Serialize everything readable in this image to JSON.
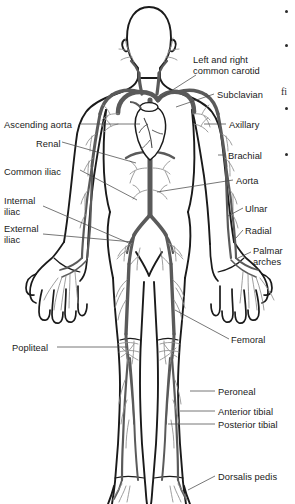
{
  "figure": {
    "view": "anterior",
    "colors": {
      "outline": "#1a1a1a",
      "artery_major": "#5a5a5a",
      "artery_minor": "#8c8c8c",
      "label_text": "#1a1a1a",
      "leader_line": "#4a4a4a",
      "background": "#ffffff"
    }
  },
  "labels_left": [
    {
      "id": "ascending-aorta",
      "text": "Ascending aorta",
      "x": 4,
      "y": 120
    },
    {
      "id": "renal",
      "text": "Renal",
      "x": 36,
      "y": 139
    },
    {
      "id": "common-iliac",
      "text": "Common iliac",
      "x": 4,
      "y": 167
    },
    {
      "id": "internal-iliac",
      "text": "Internal\niliac",
      "x": 4,
      "y": 196
    },
    {
      "id": "external-iliac",
      "text": "External\niliac",
      "x": 4,
      "y": 224
    },
    {
      "id": "popliteal",
      "text": "Popliteal",
      "x": 12,
      "y": 343
    }
  ],
  "labels_right": [
    {
      "id": "common-carotid",
      "text": "Left and right\ncommon carotid",
      "x": 193,
      "y": 55
    },
    {
      "id": "subclavian",
      "text": "Subclavian",
      "x": 217,
      "y": 90
    },
    {
      "id": "axillary",
      "text": "Axillary",
      "x": 229,
      "y": 120
    },
    {
      "id": "brachial",
      "text": "Brachial",
      "x": 228,
      "y": 151
    },
    {
      "id": "aorta",
      "text": "Aorta",
      "x": 236,
      "y": 176
    },
    {
      "id": "ulnar",
      "text": "Ulnar",
      "x": 245,
      "y": 204
    },
    {
      "id": "radial",
      "text": "Radial",
      "x": 245,
      "y": 226
    },
    {
      "id": "palmar-arches",
      "text": "Palmar\narches",
      "x": 253,
      "y": 246
    },
    {
      "id": "femoral",
      "text": "Femoral",
      "x": 231,
      "y": 335
    },
    {
      "id": "peroneal",
      "text": "Peroneal",
      "x": 218,
      "y": 387
    },
    {
      "id": "anterior-tibial",
      "text": "Anterior tibial",
      "x": 218,
      "y": 407
    },
    {
      "id": "posterior-tibial",
      "text": "Posterior tibial",
      "x": 218,
      "y": 420
    },
    {
      "id": "dorsalis-pedis",
      "text": "Dorsalis pedis",
      "x": 218,
      "y": 472
    }
  ],
  "margin_column": {
    "bullets": [
      {
        "id": "bullet-1",
        "x": 285,
        "y": 10
      },
      {
        "id": "bullet-2",
        "x": 285,
        "y": 44
      },
      {
        "id": "bullet-3",
        "x": 285,
        "y": 107
      },
      {
        "id": "bullet-4",
        "x": 285,
        "y": 153
      }
    ],
    "text_fragments": [
      {
        "id": "fragment-fi",
        "text": "fi",
        "x": 281,
        "y": 86
      }
    ]
  }
}
